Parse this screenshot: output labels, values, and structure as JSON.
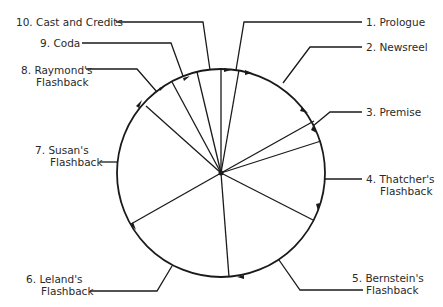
{
  "diagram": {
    "type": "circular structure diagram",
    "center": [
      221,
      173
    ],
    "radius": 104,
    "segments": [
      {
        "num": "1.",
        "line1": "Prologue",
        "line2": ""
      },
      {
        "num": "2.",
        "line1": "Newsreel",
        "line2": ""
      },
      {
        "num": "3.",
        "line1": "Premise",
        "line2": ""
      },
      {
        "num": "4.",
        "line1": "Thatcher's",
        "line2": "Flashback"
      },
      {
        "num": "5.",
        "line1": "Bernstein's",
        "line2": "Flashback"
      },
      {
        "num": "6.",
        "line1": "Leland's",
        "line2": "Flashback"
      },
      {
        "num": "7.",
        "line1": "Susan's",
        "line2": "Flashback"
      },
      {
        "num": "8.",
        "line1": "Raymond's",
        "line2": "Flashback"
      },
      {
        "num": "9.",
        "line1": "Coda",
        "line2": ""
      },
      {
        "num": "10.",
        "line1": "Cast and Credits",
        "line2": ""
      }
    ],
    "colors": {
      "line": "#1a1a1a",
      "text": "#2a2a2a",
      "background": "#ffffff"
    }
  }
}
